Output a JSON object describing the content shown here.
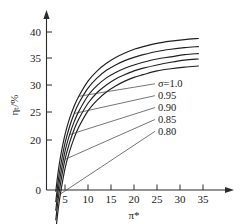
{
  "chart_data": {
    "type": "line",
    "title": "",
    "subtitle": "",
    "xlabel": "π*",
    "ylabel": "ηₜ/%",
    "xlim": [
      0,
      40
    ],
    "ylim": [
      0,
      42
    ],
    "xticks": [
      5,
      10,
      15,
      20,
      25,
      30,
      35
    ],
    "yticks": [
      0,
      20,
      25,
      30,
      35,
      40
    ],
    "xtick_labels": [
      "5",
      "10",
      "15",
      "20",
      "25",
      "30",
      "35"
    ],
    "ytick_labels": [
      "0",
      "20",
      "25",
      "30",
      "35",
      "40"
    ],
    "grid": false,
    "legend_position": "inside-right-annotations",
    "axis_arrows": true,
    "series": [
      {
        "name": "σ=1.0",
        "label": "σ=1.0",
        "sigma": 1.0,
        "x": [
          3.0,
          3.5,
          4,
          5,
          6,
          7,
          8,
          10,
          12,
          14,
          16,
          18,
          20,
          22,
          25,
          28,
          31,
          34
        ],
        "y": [
          10.5,
          14.0,
          16.8,
          21.0,
          24.0,
          26.3,
          28.1,
          30.9,
          32.8,
          34.2,
          35.3,
          36.1,
          36.8,
          37.3,
          37.9,
          38.3,
          38.6,
          38.8
        ]
      },
      {
        "name": "σ=0.95",
        "label": "0.95",
        "sigma": 0.95,
        "x": [
          3.0,
          3.5,
          4,
          5,
          6,
          7,
          8,
          10,
          12,
          14,
          16,
          18,
          20,
          22,
          25,
          28,
          31,
          34
        ],
        "y": [
          8.6,
          12.2,
          15.0,
          19.4,
          22.5,
          24.9,
          26.8,
          29.6,
          31.5,
          32.9,
          33.9,
          34.7,
          35.3,
          35.8,
          36.4,
          36.8,
          37.1,
          37.3
        ]
      },
      {
        "name": "σ=0.90",
        "label": "0.90",
        "sigma": 0.9,
        "x": [
          3.0,
          3.5,
          4,
          5,
          6,
          7,
          8,
          10,
          12,
          14,
          16,
          18,
          20,
          22,
          25,
          28,
          31,
          34
        ],
        "y": [
          7.0,
          10.6,
          13.4,
          17.9,
          21.0,
          23.4,
          25.3,
          28.2,
          30.1,
          31.5,
          32.5,
          33.3,
          33.9,
          34.4,
          35.0,
          35.4,
          35.8,
          36.0
        ]
      },
      {
        "name": "σ=0.85",
        "label": "0.85",
        "sigma": 0.85,
        "x": [
          3.0,
          3.5,
          4,
          5,
          6,
          7,
          8,
          10,
          12,
          14,
          16,
          18,
          20,
          22,
          25,
          28,
          31,
          34
        ],
        "y": [
          5.2,
          8.9,
          11.8,
          16.4,
          19.5,
          22.0,
          23.9,
          26.8,
          28.8,
          30.2,
          31.3,
          32.1,
          32.8,
          33.3,
          33.9,
          34.4,
          34.8,
          35.0
        ]
      },
      {
        "name": "σ=0.80",
        "label": "0.80",
        "sigma": 0.8,
        "x": [
          3.0,
          3.5,
          4,
          5,
          6,
          7,
          8,
          10,
          12,
          14,
          16,
          18,
          20,
          22,
          25,
          28,
          31,
          34
        ],
        "y": [
          3.2,
          7.0,
          10.0,
          14.7,
          17.9,
          20.4,
          22.4,
          25.4,
          27.4,
          28.9,
          30.0,
          30.9,
          31.6,
          32.1,
          32.8,
          33.2,
          33.5,
          33.7
        ]
      }
    ],
    "annotations": [
      {
        "text": "σ=1.0",
        "x": 25.2,
        "y": 30.4
      },
      {
        "text": "0.95",
        "x": 25.2,
        "y": 28.2
      },
      {
        "text": "0.90",
        "x": 25.2,
        "y": 26.0
      },
      {
        "text": "0.85",
        "x": 25.2,
        "y": 23.8
      },
      {
        "text": "0.80",
        "x": 25.2,
        "y": 21.6
      }
    ],
    "colors": {
      "curve": "#1f1f1f",
      "axis": "#2a2a2a",
      "leader": "#3a3a3a",
      "background": "#ffffff"
    }
  }
}
